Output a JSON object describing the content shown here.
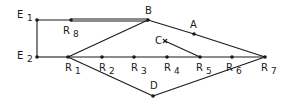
{
  "diagram": {
    "type": "network-graph",
    "colors": {
      "line": "#1a1a1a",
      "background": "#ffffff"
    },
    "nodes": [
      {
        "id": "E1",
        "label": "E",
        "sub": "1",
        "x": 37,
        "y": 20
      },
      {
        "id": "E2",
        "label": "E",
        "sub": "2",
        "x": 37,
        "y": 57
      },
      {
        "id": "R8",
        "label": "R",
        "sub": "8",
        "x": 71,
        "y": 20
      },
      {
        "id": "B",
        "label": "B",
        "sub": "",
        "x": 148,
        "y": 20
      },
      {
        "id": "A",
        "label": "A",
        "sub": "",
        "x": 194,
        "y": 34
      },
      {
        "id": "C",
        "label": "C",
        "sub": "",
        "x": 165,
        "y": 41
      },
      {
        "id": "R1",
        "label": "R",
        "sub": "1",
        "x": 68,
        "y": 57
      },
      {
        "id": "R2",
        "label": "R",
        "sub": "2",
        "x": 102,
        "y": 57
      },
      {
        "id": "R3",
        "label": "R",
        "sub": "3",
        "x": 134,
        "y": 57
      },
      {
        "id": "R4",
        "label": "R",
        "sub": "4",
        "x": 167,
        "y": 57
      },
      {
        "id": "R5",
        "label": "R",
        "sub": "5",
        "x": 200,
        "y": 57
      },
      {
        "id": "R6",
        "label": "R",
        "sub": "6",
        "x": 232,
        "y": 57
      },
      {
        "id": "R7",
        "label": "R",
        "sub": "7",
        "x": 265,
        "y": 57
      },
      {
        "id": "D",
        "label": "D",
        "sub": "",
        "x": 153,
        "y": 96
      }
    ],
    "edges": [
      {
        "from": "E1",
        "to": "R8",
        "style": "single"
      },
      {
        "from": "R8",
        "to": "B",
        "style": "double"
      },
      {
        "from": "E1",
        "to": "E2",
        "style": "single"
      },
      {
        "from": "E2",
        "to": "R1",
        "style": "single"
      },
      {
        "from": "R1",
        "to": "B",
        "style": "single"
      },
      {
        "from": "R1",
        "to": "R7",
        "style": "single"
      },
      {
        "from": "R1",
        "to": "D",
        "style": "single"
      },
      {
        "from": "D",
        "to": "R7",
        "style": "single"
      },
      {
        "from": "B",
        "to": "A",
        "style": "single"
      },
      {
        "from": "A",
        "to": "R7",
        "style": "single"
      },
      {
        "from": "C",
        "to": "R5",
        "style": "single"
      }
    ]
  }
}
